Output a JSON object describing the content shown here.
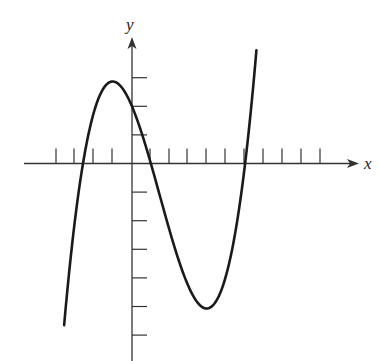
{
  "chart_data": {
    "type": "line",
    "title": "",
    "xlabel": "x",
    "ylabel": "y",
    "x_ticks": [
      -7,
      -6,
      -5,
      -4,
      -3,
      -2,
      -1,
      1,
      2,
      3,
      4,
      5,
      6,
      7,
      8,
      9,
      10
    ],
    "x_tick_positions_px": [
      56,
      74,
      93,
      112,
      150,
      169,
      187,
      206,
      225,
      244,
      263,
      282,
      301,
      320
    ],
    "y_ticks": [
      3,
      2,
      1,
      -1,
      -2,
      -3,
      -4,
      -5,
      -6
    ],
    "xlim": [
      -5.7,
      11.5
    ],
    "ylim": [
      -6.8,
      4.5
    ],
    "grid": false,
    "legend": null,
    "series": [
      {
        "name": "f(x)",
        "model": "0.128*(x+2.6)*(x-1)*(x-6)",
        "key_points": [
          {
            "label": "left end",
            "x": -3.5,
            "y": -6.5
          },
          {
            "label": "x-intercept",
            "x": -2.6,
            "y": 0
          },
          {
            "label": "local max",
            "x": -1,
            "y": 2.9
          },
          {
            "label": "y-intercept",
            "x": 0,
            "y": 2
          },
          {
            "label": "x-intercept",
            "x": 1,
            "y": 0
          },
          {
            "label": "local min",
            "x": 4,
            "y": -5.3
          },
          {
            "label": "x-intercept",
            "x": 6,
            "y": 0
          },
          {
            "label": "right end",
            "x": 6.6,
            "y": 3.5
          }
        ],
        "color": "#1a1a1a"
      }
    ]
  },
  "axes": {
    "x_label": "x",
    "y_label": "y",
    "color": "#333333"
  }
}
